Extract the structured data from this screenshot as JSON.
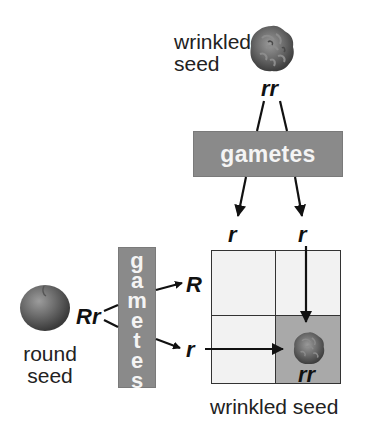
{
  "parent_wrinkled": {
    "label_line1": "wrinkled",
    "label_line2": "seed",
    "genotype": "rr"
  },
  "parent_round": {
    "label_line1": "round",
    "label_line2": "seed",
    "genotype": "Rr"
  },
  "gametes_horizontal": {
    "label": "gametes"
  },
  "gametes_vertical": {
    "letters": [
      "g",
      "a",
      "m",
      "e",
      "t",
      "e",
      "s"
    ]
  },
  "top_gametes": [
    "r",
    "r"
  ],
  "side_gametes": [
    "R",
    "r"
  ],
  "punnett": {
    "highlighted_cell": {
      "row": 1,
      "col": 1,
      "genotype": "rr"
    },
    "caption": "wrinkled seed"
  },
  "colors": {
    "gamete_box": "#8a8a8a",
    "cell_empty": "#f2f2f2",
    "cell_highlight": "#a9a9a9",
    "seed": "#5e5e5e"
  }
}
